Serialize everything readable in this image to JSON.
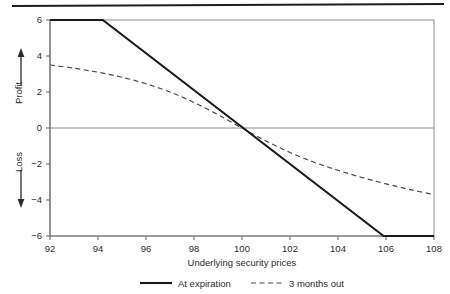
{
  "figure": {
    "top_rule": "horizontal-rule",
    "background_color": "#ffffff",
    "line_color": "#1a1a1a",
    "axis_color": "#777777"
  },
  "chart_data": {
    "type": "line",
    "title": "",
    "subtitle": "",
    "xlabel": "Underlying security prices",
    "ylabel_profit": "Profit",
    "ylabel_loss": "Loss",
    "profit_arrow": "↑",
    "loss_arrow": "↓",
    "xlim": [
      92,
      108
    ],
    "ylim": [
      -6,
      6
    ],
    "xticks": [
      92,
      94,
      96,
      98,
      100,
      102,
      104,
      106,
      108
    ],
    "xtick_labels": [
      "92",
      "94",
      "96",
      "98",
      "100",
      "102",
      "104",
      "106",
      "108"
    ],
    "yticks": [
      6,
      4,
      2,
      0,
      -2,
      -4,
      -6
    ],
    "ytick_labels": [
      "6",
      "4",
      "2",
      "0",
      "−2",
      "−4",
      "−6"
    ],
    "grid": false,
    "zero_line": 0,
    "legend_position": "below",
    "series": [
      {
        "name": "At expiration",
        "style": "solid",
        "color": "#1a1a1a",
        "x": [
          92,
          94.2,
          105.9,
          108
        ],
        "values": [
          6,
          6,
          -6,
          -6
        ]
      },
      {
        "name": "3 months out",
        "style": "dashed",
        "color": "#4a4a4a",
        "x": [
          92,
          93,
          94,
          95,
          96,
          97,
          98,
          99,
          100,
          101,
          102,
          103,
          104,
          105,
          106,
          107,
          108
        ],
        "values": [
          3.5,
          3.32,
          3.1,
          2.82,
          2.46,
          2.0,
          1.42,
          0.74,
          0.0,
          -0.72,
          -1.36,
          -1.9,
          -2.35,
          -2.75,
          -3.1,
          -3.42,
          -3.7
        ]
      }
    ]
  },
  "legend": {
    "items": [
      {
        "label": "At expiration",
        "style": "solid"
      },
      {
        "label": "3 months out",
        "style": "dashed"
      }
    ]
  }
}
